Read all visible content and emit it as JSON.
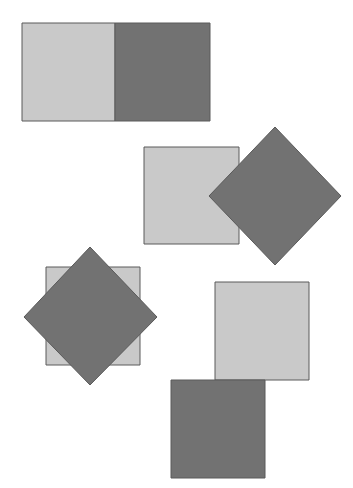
{
  "colors": {
    "background": "#ffffff",
    "light": "#c9c9c9",
    "dark": "#727272",
    "stroke": "#5a5a5a"
  },
  "groups": [
    {
      "name": "pair-side-by-side",
      "shapes": [
        {
          "kind": "square",
          "tone": "light",
          "points": "22,23 115,23 115,121 22,121"
        },
        {
          "kind": "square",
          "tone": "dark",
          "points": "115,23 210,23 210,121 115,121"
        }
      ]
    },
    {
      "name": "pair-square-and-diamond-overlap",
      "shapes": [
        {
          "kind": "square",
          "tone": "light",
          "points": "144,147 239,147 239,244 144,244"
        },
        {
          "kind": "diamond",
          "tone": "dark",
          "points": "275,127 341,196 275,265 209,196"
        }
      ]
    },
    {
      "name": "pair-diamond-over-square",
      "shapes": [
        {
          "kind": "square",
          "tone": "light",
          "points": "46,267 140,267 140,365 46,365"
        },
        {
          "kind": "diamond",
          "tone": "dark",
          "points": "90,247 157,317 90,385 24,317"
        }
      ]
    },
    {
      "name": "pair-diagonal-touching",
      "shapes": [
        {
          "kind": "square",
          "tone": "light",
          "points": "215,282 309,282 309,380 215,380"
        },
        {
          "kind": "square",
          "tone": "dark",
          "points": "171,380 265,380 265,478 171,478"
        }
      ]
    }
  ]
}
